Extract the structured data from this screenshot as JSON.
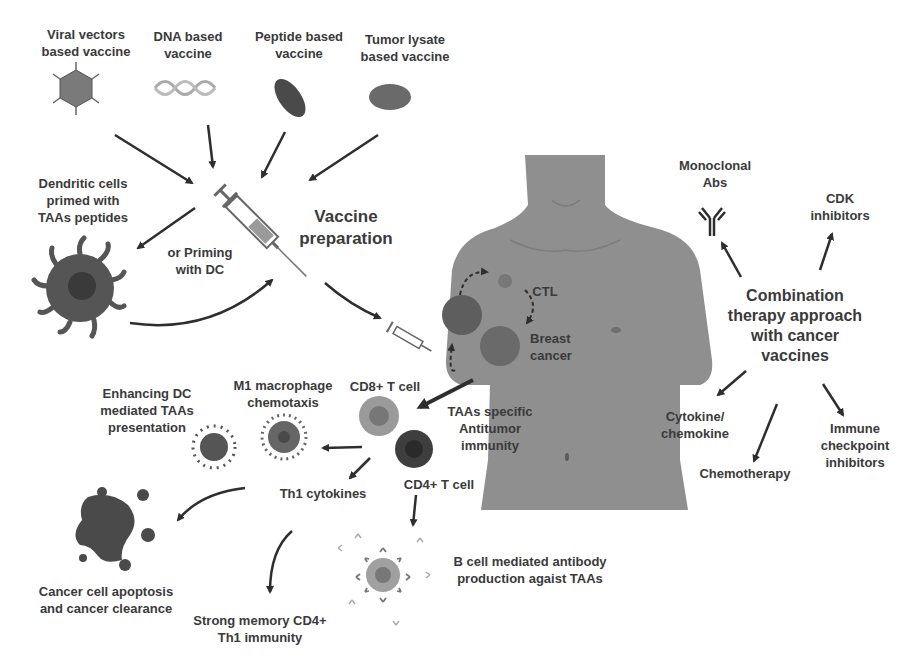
{
  "diagram": {
    "type": "flow-illustration",
    "topic": "Cancer vaccines and combination therapy",
    "colors": {
      "text": "#3a3a3a",
      "arrow": "#2e2e2e",
      "body": "#8f8f8f",
      "cell_dark": "#4a4a4a",
      "cell_light": "#9a9a9a"
    }
  },
  "vaccine_types": [
    {
      "label": "Viral vectors\nbased vaccine",
      "icon": "virus-icon"
    },
    {
      "label": "DNA based\nvaccine",
      "icon": "dna-helix-icon"
    },
    {
      "label": "Peptide based\nvaccine",
      "icon": "peptide-icon"
    },
    {
      "label": "Tumor lysate\nbased vaccine",
      "icon": "tumor-lysate-icon"
    }
  ],
  "preparation": {
    "dc_label": "Dendritic cells\nprimed with\nTAAs peptides",
    "priming_label": "or Priming\nwith DC",
    "vaccine_prep_label": "Vaccine\npreparation"
  },
  "body": {
    "ctl_label": "CTL",
    "tumor_label": "Breast\ncancer",
    "immunity_label": "TAAs specific\nAntitumor\nimmunity"
  },
  "immune_response": {
    "cd8_label": "CD8+ T cell",
    "cd4_label": "CD4+ T cell",
    "m1_label": "M1 macrophage\nchemotaxis",
    "dc_enhance_label": "Enhancing DC\nmediated TAAs\npresentation",
    "th1_label": "Th1 cytokines",
    "apoptosis_label": "Cancer cell apoptosis\nand cancer clearance",
    "memory_label": "Strong memory CD4+\nTh1 immunity",
    "bcell_label": "B cell mediated antibody\nproduction agaist TAAs"
  },
  "combination": {
    "center_label": "Combination\ntherapy approach\nwith cancer\nvaccines",
    "items": [
      {
        "label": "Monoclonal\nAbs"
      },
      {
        "label": "CDK\ninhibitors"
      },
      {
        "label": "Cytokine/\nchemokine"
      },
      {
        "label": "Chemotherapy"
      },
      {
        "label": "Immune\ncheckpoint\ninhibitors"
      }
    ]
  }
}
